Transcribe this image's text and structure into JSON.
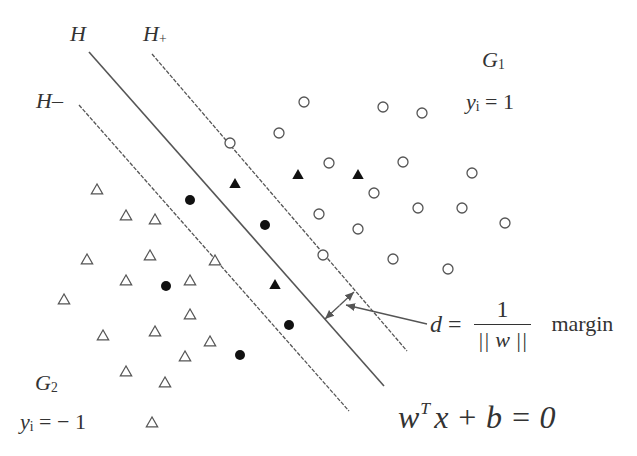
{
  "figure": {
    "labels": {
      "H": "H",
      "H_plus_main": "H",
      "H_plus_sub": "+",
      "H_minus_main": "H",
      "H_minus_sub": "–",
      "G1_main": "G",
      "G1_sub": "1",
      "y1_main": "y",
      "y1_sub": "i",
      "y1_rest": " = 1",
      "G2_main": "G",
      "G2_sub": "2",
      "y2_main": "y",
      "y2_sub": "i",
      "y2_rest": " = − 1",
      "d": "d",
      "eq": " = ",
      "frac_num": "1",
      "frac_den": "|| w ||",
      "margin": "margin",
      "hyper_w": "w",
      "hyper_T": "T",
      "hyper_rest": "x + b = 0"
    },
    "lines": [
      {
        "name": "H",
        "style": "solid",
        "x1": 89,
        "y1": 52,
        "x2": 384,
        "y2": 386
      },
      {
        "name": "H+",
        "style": "dashed",
        "x1": 152,
        "y1": 54,
        "x2": 407,
        "y2": 351
      },
      {
        "name": "H-",
        "style": "dashed",
        "x1": 79,
        "y1": 105,
        "x2": 349,
        "y2": 411
      }
    ],
    "margin_arrow": {
      "x1": 354,
      "y1": 292,
      "x2": 325,
      "y2": 319
    },
    "pointer": {
      "x1": 427,
      "y1": 324,
      "x2": 346,
      "y2": 305
    },
    "colors": {
      "stroke": "#555555",
      "text": "#333333",
      "filled": "#111111"
    }
  },
  "chart_data": {
    "type": "scatter",
    "title": "",
    "xlabel": "",
    "ylabel": "",
    "series": [
      {
        "name": "G1 (y_i = 1) open circles",
        "marker": "circle-open",
        "points": [
          [
            304,
            102
          ],
          [
            279,
            133
          ],
          [
            383,
            107
          ],
          [
            422,
            113
          ],
          [
            230,
            143
          ],
          [
            329,
            163
          ],
          [
            403,
            162
          ],
          [
            472,
            173
          ],
          [
            374,
            193
          ],
          [
            319,
            214
          ],
          [
            418,
            208
          ],
          [
            462,
            208
          ],
          [
            505,
            223
          ],
          [
            358,
            229
          ],
          [
            323,
            255
          ],
          [
            393,
            259
          ],
          [
            448,
            269
          ]
        ]
      },
      {
        "name": "G1 support/misclassified filled triangles",
        "marker": "triangle-filled",
        "points": [
          [
            235,
            184
          ],
          [
            298,
            175
          ],
          [
            358,
            175
          ],
          [
            275,
            285
          ]
        ]
      },
      {
        "name": "G2 (y_i = -1) open triangles",
        "marker": "triangle-open",
        "points": [
          [
            97,
            190
          ],
          [
            126,
            216
          ],
          [
            155,
            220
          ],
          [
            87,
            260
          ],
          [
            150,
            256
          ],
          [
            215,
            261
          ],
          [
            126,
            281
          ],
          [
            190,
            281
          ],
          [
            64,
            300
          ],
          [
            190,
            315
          ],
          [
            103,
            336
          ],
          [
            155,
            332
          ],
          [
            210,
            342
          ],
          [
            185,
            357
          ],
          [
            126,
            372
          ],
          [
            165,
            383
          ],
          [
            152,
            423
          ]
        ]
      },
      {
        "name": "G2 support/misclassified filled circles",
        "marker": "circle-filled",
        "points": [
          [
            190,
            200
          ],
          [
            265,
            225
          ],
          [
            166,
            286
          ],
          [
            289,
            325
          ],
          [
            240,
            355
          ]
        ]
      }
    ]
  }
}
